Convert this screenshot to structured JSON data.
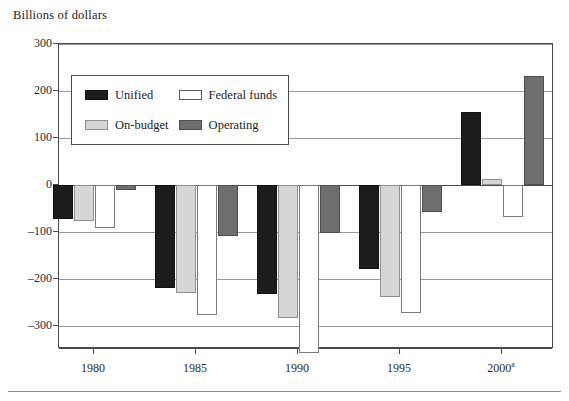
{
  "chart_data": {
    "type": "bar",
    "title": "",
    "ylabel": "Billions of dollars",
    "xlabel": "",
    "categories": [
      "1980",
      "1985",
      "1990",
      "1995",
      "2000"
    ],
    "category_labels": [
      "1980",
      "1985",
      "1990",
      "1995",
      "2000"
    ],
    "category_superscripts": [
      "",
      "",
      "",
      "",
      "a"
    ],
    "series": [
      {
        "name": "Unified",
        "color": "#1c1c1c",
        "values": [
          -74,
          -221,
          -232,
          -179,
          156
        ]
      },
      {
        "name": "On-budget",
        "color": "#d6d6d6",
        "values": [
          -78,
          -230,
          -284,
          -240,
          12
        ]
      },
      {
        "name": "Federal funds",
        "color": "#ffffff",
        "values": [
          -92,
          -277,
          -358,
          -274,
          -68
        ]
      },
      {
        "name": "Operating",
        "color": "#6e6e6e",
        "values": [
          -12,
          -110,
          -102,
          -58,
          232
        ]
      }
    ],
    "ylim": [
      -350,
      300
    ],
    "yticks": [
      300,
      200,
      100,
      0,
      -100,
      -200,
      -300
    ],
    "ytick_labels": [
      "300",
      "200",
      "100",
      "0",
      "–100",
      "–200",
      "–300"
    ],
    "grid": true,
    "legend_position": "upper-left-inside",
    "legend": [
      "Unified",
      "Federal funds",
      "On-budget",
      "Operating"
    ]
  },
  "axis": {
    "y_title": "Billions of dollars"
  },
  "legend": {
    "entries": [
      {
        "label": "Unified",
        "swatch": "unified"
      },
      {
        "label": "Federal funds",
        "swatch": "federal"
      },
      {
        "label": "On-budget",
        "swatch": "onbudget"
      },
      {
        "label": "Operating",
        "swatch": "operating"
      }
    ]
  }
}
